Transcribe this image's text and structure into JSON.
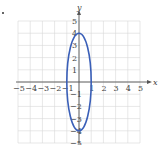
{
  "chart_data": {
    "type": "line",
    "title": "",
    "marker": "•",
    "xlabel": "x",
    "ylabel": "y",
    "xlim": [
      -5,
      5
    ],
    "ylim": [
      -5,
      5
    ],
    "grid": true,
    "x_ticks": [
      "-5",
      "-4",
      "-3",
      "-2",
      "-1",
      "1",
      "2",
      "3",
      "4",
      "5"
    ],
    "y_ticks": [
      "5",
      "4",
      "3",
      "2",
      "1",
      "-1",
      "-2",
      "-3",
      "-4",
      "-5"
    ],
    "series": [
      {
        "name": "ellipse",
        "shape": "ellipse",
        "center": [
          0,
          0
        ],
        "semi_axis_x": 1,
        "semi_axis_y": 4,
        "color": "#3a5fb8"
      }
    ]
  }
}
